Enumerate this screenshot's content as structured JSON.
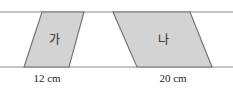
{
  "figure": {
    "colors": {
      "shape_fill": "#d3d3d3",
      "shape_stroke": "#6e6e6e",
      "guide_line": "#8a8a8a",
      "label_text": "#2b2b2b",
      "dimension_text": "#1c1c1c",
      "background": "#ffffff"
    },
    "guide_lines": [
      {
        "name": "top-parallel-line",
        "y": 12,
        "x1": 0,
        "x2": 233
      },
      {
        "name": "bottom-parallel-line",
        "y": 67,
        "x1": 0,
        "x2": 233
      }
    ],
    "shapes": [
      {
        "id": "parallelogram-ga",
        "label": "가",
        "label_x": 54,
        "label_y": 39,
        "points": "42,12 84,12 69,67 24,67",
        "base_label": "12 cm",
        "base_value": 12,
        "base_unit": "cm",
        "base_label_x": 47,
        "base_label_y": 78
      },
      {
        "id": "parallelogram-na",
        "label": "나",
        "label_x": 163,
        "label_y": 39,
        "points": "113,12 190,12 212,67 137,67",
        "base_label": "20 cm",
        "base_value": 20,
        "base_unit": "cm",
        "base_label_x": 173,
        "base_label_y": 78
      }
    ]
  }
}
